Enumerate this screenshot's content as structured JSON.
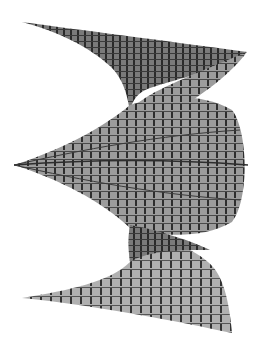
{
  "figure": {
    "description": "3D rendered twisted helicoidal surface mesh in grayscale",
    "colors": {
      "background": "#ffffff",
      "surface_light": "#a8a8a8",
      "surface_mid": "#8c8c8c",
      "surface_dark": "#5a5a5a",
      "grid_line": "#2e2e2e"
    },
    "lobes": [
      {
        "name": "top-sheet",
        "tip_left": [
          22,
          22
        ],
        "tip_right": [
          247,
          52
        ],
        "waist": [
          133,
          85
        ]
      },
      {
        "name": "middle-bulge",
        "tip_left": [
          14,
          165
        ],
        "right_extent": [
          248,
          165
        ]
      },
      {
        "name": "bottom-sheet",
        "tip_left": [
          22,
          298
        ],
        "tip_right": [
          232,
          333
        ],
        "waist": [
          133,
          235
        ]
      }
    ]
  }
}
